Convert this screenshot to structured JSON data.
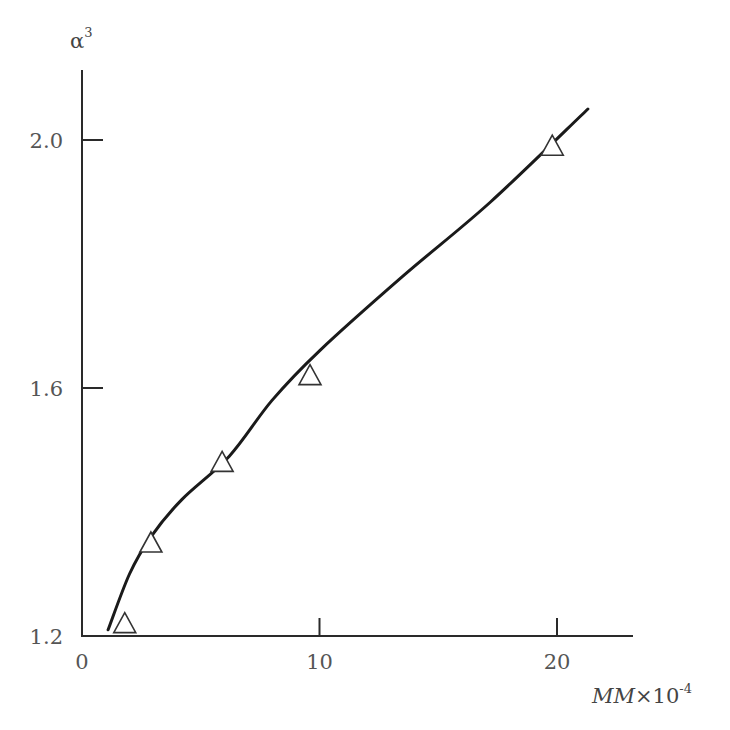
{
  "chart_data": {
    "type": "scatter",
    "title": "",
    "xlabel": "MM×10⁻⁴",
    "xlabel_parts": {
      "main": "MM",
      "times": "×10",
      "sup": "-4"
    },
    "ylabel": "α³",
    "ylabel_parts": {
      "main": "α",
      "sup": "3"
    },
    "xlim": [
      0,
      23
    ],
    "ylim": [
      1.2,
      2.1
    ],
    "x_ticks": [
      0,
      10,
      20
    ],
    "x_tick_labels": [
      "0",
      "10",
      "20"
    ],
    "y_ticks": [
      1.2,
      1.6,
      2.0
    ],
    "y_tick_labels": [
      "1.2",
      "1.6",
      "2.0"
    ],
    "grid": false,
    "legend": null,
    "series": [
      {
        "name": "measured",
        "kind": "scatter",
        "marker": "open-triangle",
        "x": [
          1.8,
          2.9,
          5.9,
          9.6,
          19.8
        ],
        "y": [
          1.22,
          1.35,
          1.48,
          1.62,
          1.99
        ]
      },
      {
        "name": "fitted curve",
        "kind": "line",
        "x": [
          1.1,
          2.0,
          2.9,
          4.2,
          6.2,
          8.0,
          10.0,
          13.5,
          17.2,
          21.3
        ],
        "y": [
          1.21,
          1.3,
          1.36,
          1.42,
          1.49,
          1.58,
          1.66,
          1.78,
          1.9,
          2.05
        ]
      }
    ]
  }
}
